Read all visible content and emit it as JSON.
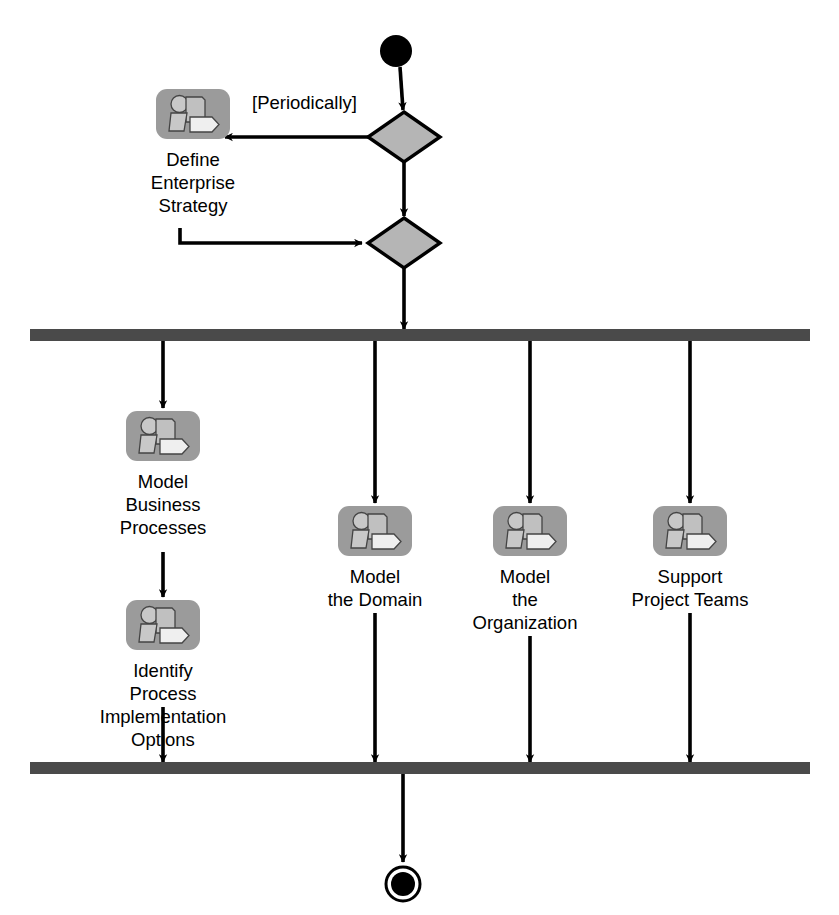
{
  "diagram": {
    "type": "uml-activity-diagram",
    "background_color": "#ffffff",
    "colors": {
      "line": "#000000",
      "activity_icon_bg": "#9b9b9b",
      "activity_icon_shape_light": "#c8c8c8",
      "activity_icon_shape_white": "#efefef",
      "decision_fill": "#b5b5b5",
      "bar_fill": "#4a4a4a",
      "node_fill": "#000000",
      "text": "#000000"
    }
  },
  "nodes": {
    "start": {
      "name": "initial-node",
      "shape": "filled-circle",
      "cx": 396,
      "cy": 51,
      "r": 16
    },
    "decision_1": {
      "name": "decision-node-periodic",
      "shape": "diamond",
      "cx": 404,
      "cy": 137,
      "rx": 36,
      "ry": 25
    },
    "decision_2": {
      "name": "merge-node",
      "shape": "diamond",
      "cx": 404,
      "cy": 243,
      "rx": 36,
      "ry": 25
    },
    "fork_bar": {
      "name": "fork-bar",
      "x": 30,
      "y": 329,
      "width": 780,
      "height": 12
    },
    "join_bar": {
      "name": "join-bar",
      "x": 30,
      "y": 762,
      "width": 780,
      "height": 12
    },
    "end": {
      "name": "final-node",
      "shape": "bullseye",
      "cx": 403,
      "cy": 884,
      "r_outer": 17,
      "r_inner": 12
    }
  },
  "guards": [
    {
      "name": "guard-periodically",
      "text": "[Periodically]",
      "x": 252,
      "y": 92
    }
  ],
  "activities": [
    {
      "id": "define-enterprise-strategy",
      "name": "activity-define-enterprise-strategy",
      "label": "Define\nEnterprise\nStrategy",
      "icon": "actor-process-icon",
      "icon_x": 156,
      "icon_y": 89,
      "label_x": 119,
      "label_y": 148,
      "label_width": 148
    },
    {
      "id": "model-business-processes",
      "name": "activity-model-business-processes",
      "label": "Model\nBusiness\nProcesses",
      "icon": "actor-process-icon",
      "icon_x": 126,
      "icon_y": 411,
      "label_x": 89,
      "label_y": 470,
      "label_width": 148
    },
    {
      "id": "identify-process-implementation-options",
      "name": "activity-identify-process-implementation-options",
      "label": "Identify\nProcess\nImplementation\nOptions",
      "icon": "actor-process-icon",
      "icon_x": 126,
      "icon_y": 600,
      "label_x": 74,
      "label_y": 659,
      "label_width": 178
    },
    {
      "id": "model-the-domain",
      "name": "activity-model-the-domain",
      "label": "Model\nthe Domain",
      "icon": "actor-process-icon",
      "icon_x": 338,
      "icon_y": 506,
      "label_x": 301,
      "label_y": 565,
      "label_width": 148
    },
    {
      "id": "model-the-organization",
      "name": "activity-model-the-organization",
      "label": "Model\nthe\nOrganization",
      "icon": "actor-process-icon",
      "icon_x": 493,
      "icon_y": 506,
      "label_x": 446,
      "label_y": 565,
      "label_width": 158
    },
    {
      "id": "support-project-teams",
      "name": "activity-support-project-teams",
      "label": "Support\nProject Teams",
      "icon": "actor-process-icon",
      "icon_x": 653,
      "icon_y": 506,
      "label_x": 601,
      "label_y": 565,
      "label_width": 178
    }
  ],
  "flows": [
    {
      "name": "flow-start-to-decision1",
      "from": "start",
      "to": "decision_1"
    },
    {
      "name": "flow-decision1-to-define-strategy",
      "from": "decision_1",
      "to": "define-enterprise-strategy",
      "guard": "[Periodically]"
    },
    {
      "name": "flow-define-strategy-to-merge",
      "from": "define-enterprise-strategy",
      "to": "decision_2"
    },
    {
      "name": "flow-decision1-to-decision2",
      "from": "decision_1",
      "to": "decision_2"
    },
    {
      "name": "flow-decision2-to-fork",
      "from": "decision_2",
      "to": "fork_bar"
    },
    {
      "name": "flow-fork-to-model-business-processes",
      "from": "fork_bar",
      "to": "model-business-processes"
    },
    {
      "name": "flow-model-business-processes-to-identify-options",
      "from": "model-business-processes",
      "to": "identify-process-implementation-options"
    },
    {
      "name": "flow-identify-options-to-join",
      "from": "identify-process-implementation-options",
      "to": "join_bar"
    },
    {
      "name": "flow-fork-to-model-the-domain",
      "from": "fork_bar",
      "to": "model-the-domain"
    },
    {
      "name": "flow-model-the-domain-to-join",
      "from": "model-the-domain",
      "to": "join_bar"
    },
    {
      "name": "flow-fork-to-model-the-organization",
      "from": "fork_bar",
      "to": "model-the-organization"
    },
    {
      "name": "flow-model-the-organization-to-join",
      "from": "model-the-organization",
      "to": "join_bar"
    },
    {
      "name": "flow-fork-to-support-project-teams",
      "from": "fork_bar",
      "to": "support-project-teams"
    },
    {
      "name": "flow-support-project-teams-to-join",
      "from": "support-project-teams",
      "to": "join_bar"
    },
    {
      "name": "flow-join-to-end",
      "from": "join_bar",
      "to": "end"
    }
  ]
}
